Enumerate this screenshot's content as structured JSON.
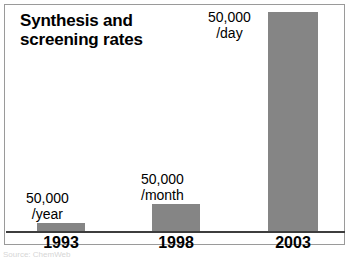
{
  "figure": {
    "title_line1": "Synthesis and",
    "title_line2": "screening rates",
    "source_credit": "Source: ChemWeb"
  },
  "chart_data": {
    "type": "bar",
    "title": "Synthesis and screening rates",
    "xlabel": "",
    "ylabel": "",
    "grid": false,
    "legend": false,
    "categories": [
      "1993",
      "1998",
      "2003"
    ],
    "values": [
      50000,
      600000,
      18250000
    ],
    "value_labels": [
      {
        "number": "50,000",
        "unit": "/year"
      },
      {
        "number": "50,000",
        "unit": "/month"
      },
      {
        "number": "50,000",
        "unit": "/day"
      }
    ],
    "bar_color": "#858585",
    "axis_color": "#3d3d3d",
    "text_color": "#000000",
    "background": "#ffffff"
  },
  "bars": [
    {
      "year": "1993",
      "number": "50,000",
      "unit": "/year",
      "left": 37,
      "width": 48,
      "height": 8,
      "label_left": 26,
      "label_top": 191,
      "year_left": 21
    },
    {
      "year": "1998",
      "number": "50,000",
      "unit": "/month",
      "left": 152,
      "width": 48,
      "height": 27,
      "label_left": 141,
      "label_top": 172,
      "year_left": 136
    },
    {
      "year": "2003",
      "number": "50,000",
      "unit": "/day",
      "left": 268,
      "width": 50,
      "height": 219,
      "label_left": 208,
      "label_top": 10,
      "year_left": 252
    }
  ]
}
